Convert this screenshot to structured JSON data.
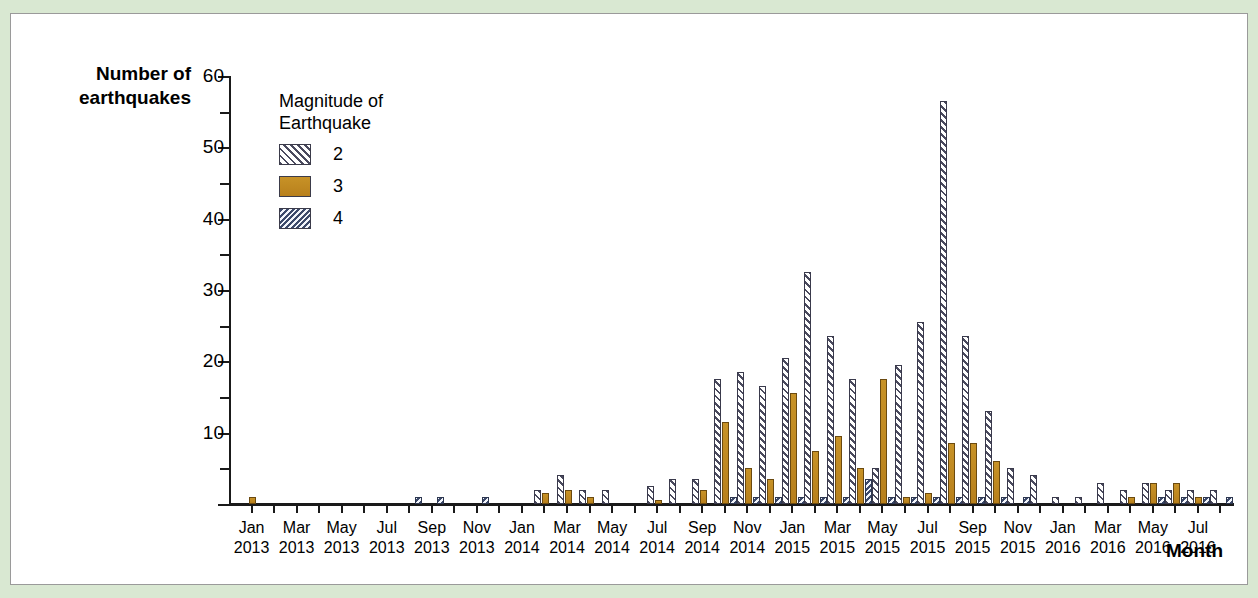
{
  "figure": {
    "y_axis_title": "Number of\nearthquakes",
    "x_axis_title": "Month",
    "background_color": "#d9e8d2",
    "panel_color": "#ffffff"
  },
  "legend": {
    "title": "Magnitude of\nEarthquake",
    "entries": [
      {
        "label": "2",
        "swatch": "hatch-diagonal-light",
        "color": "#4a4a5e"
      },
      {
        "label": "3",
        "swatch": "solid-orange",
        "color": "#c08a22"
      },
      {
        "label": "4",
        "swatch": "hatch-diagonal-blue",
        "color": "#3d4a6b"
      }
    ]
  },
  "chart_data": {
    "type": "bar",
    "title": "",
    "xlabel": "Month",
    "ylabel": "Number of earthquakes",
    "ylim": [
      0,
      60
    ],
    "yticks_major": [
      0,
      10,
      20,
      30,
      40,
      50,
      60
    ],
    "yticks_minor": [
      5,
      15,
      25,
      35,
      45,
      55
    ],
    "grid": false,
    "legend_position": "upper-left-inside",
    "categories": [
      "Jan 2013",
      "Feb 2013",
      "Mar 2013",
      "Apr 2013",
      "May 2013",
      "Jun 2013",
      "Jul 2013",
      "Aug 2013",
      "Sep 2013",
      "Oct 2013",
      "Nov 2013",
      "Dec 2013",
      "Jan 2014",
      "Feb 2014",
      "Mar 2014",
      "Apr 2014",
      "May 2014",
      "Jun 2014",
      "Jul 2014",
      "Aug 2014",
      "Sep 2014",
      "Oct 2014",
      "Nov 2014",
      "Dec 2014",
      "Jan 2015",
      "Feb 2015",
      "Mar 2015",
      "Apr 2015",
      "May 2015",
      "Jun 2015",
      "Jul 2015",
      "Aug 2015",
      "Sep 2015",
      "Oct 2015",
      "Nov 2015",
      "Dec 2015",
      "Jan 2016",
      "Feb 2016",
      "Mar 2016",
      "Apr 2016",
      "May 2016",
      "Jun 2016",
      "Jul 2016",
      "Aug 2016"
    ],
    "tick_labels": [
      {
        "index": 0,
        "text": "Jan\n2013"
      },
      {
        "index": 2,
        "text": "Mar\n2013"
      },
      {
        "index": 4,
        "text": "May\n2013"
      },
      {
        "index": 6,
        "text": "Jul\n2013"
      },
      {
        "index": 8,
        "text": "Sep\n2013"
      },
      {
        "index": 10,
        "text": "Nov\n2013"
      },
      {
        "index": 12,
        "text": "Jan\n2014"
      },
      {
        "index": 14,
        "text": "Mar\n2014"
      },
      {
        "index": 16,
        "text": "May\n2014"
      },
      {
        "index": 18,
        "text": "Jul\n2014"
      },
      {
        "index": 20,
        "text": "Sep\n2014"
      },
      {
        "index": 22,
        "text": "Nov\n2014"
      },
      {
        "index": 24,
        "text": "Jan\n2015"
      },
      {
        "index": 26,
        "text": "Mar\n2015"
      },
      {
        "index": 28,
        "text": "May\n2015"
      },
      {
        "index": 30,
        "text": "Jul\n2015"
      },
      {
        "index": 32,
        "text": "Sep\n2015"
      },
      {
        "index": 34,
        "text": "Nov\n2015"
      },
      {
        "index": 36,
        "text": "Jan\n2016"
      },
      {
        "index": 38,
        "text": "Mar\n2016"
      },
      {
        "index": 40,
        "text": "May\n2016"
      },
      {
        "index": 42,
        "text": "Jul\n2016"
      }
    ],
    "series": [
      {
        "name": "2",
        "values": [
          0,
          0,
          0,
          0,
          0,
          0,
          0,
          0,
          0,
          0,
          0,
          0,
          0,
          2,
          4,
          2,
          2,
          0,
          2.5,
          3.5,
          3.5,
          17.5,
          18.5,
          16.5,
          20.5,
          32.5,
          23.5,
          17.5,
          5,
          19.5,
          25.5,
          56.5,
          23.5,
          13,
          5,
          4,
          1,
          1,
          3,
          2,
          3,
          2,
          2,
          2
        ]
      },
      {
        "name": "3",
        "values": [
          1,
          0,
          0,
          0,
          0,
          0,
          0,
          0,
          0,
          0,
          0,
          0,
          0,
          1.5,
          2,
          1,
          0,
          0,
          0.5,
          0,
          2,
          11.5,
          5,
          3.5,
          15.5,
          7.5,
          9.5,
          5,
          17.5,
          1,
          1.5,
          8.5,
          8.5,
          6,
          0,
          0,
          0,
          0,
          0,
          1,
          3,
          3,
          1,
          0
        ]
      },
      {
        "name": "4",
        "values": [
          0,
          0,
          0,
          0,
          0,
          0,
          0,
          1,
          1,
          0,
          1,
          0,
          0,
          0,
          0,
          0,
          0,
          0,
          0,
          0,
          0,
          1,
          1,
          1,
          1,
          1,
          1,
          3.5,
          1,
          1,
          1,
          1,
          1,
          1,
          1,
          0,
          0,
          0,
          0,
          0,
          1,
          1,
          1,
          1
        ]
      }
    ]
  }
}
